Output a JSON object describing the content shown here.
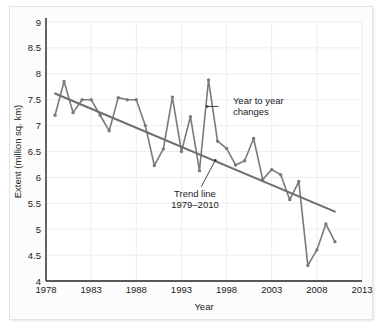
{
  "chart_data": {
    "type": "line",
    "title": "",
    "xlabel": "Year",
    "ylabel": "Extent (million sq. km)",
    "xlim": [
      1978,
      2013
    ],
    "ylim": [
      4,
      9
    ],
    "xticks": [
      1978,
      1983,
      1988,
      1993,
      1998,
      2003,
      2008,
      2013
    ],
    "yticks": [
      4,
      4.5,
      5,
      5.5,
      6,
      6.5,
      7,
      7.5,
      8,
      8.5,
      9
    ],
    "grid": true,
    "legend_position": "none",
    "series": [
      {
        "name": "Year to year changes",
        "color": "#7a7a7a",
        "marker": "circle",
        "x": [
          1979,
          1980,
          1981,
          1982,
          1983,
          1984,
          1985,
          1986,
          1987,
          1988,
          1989,
          1990,
          1991,
          1992,
          1993,
          1994,
          1995,
          1996,
          1997,
          1998,
          1999,
          2000,
          2001,
          2002,
          2003,
          2004,
          2005,
          2006,
          2007,
          2008,
          2009,
          2010
        ],
        "values": [
          7.2,
          7.85,
          7.25,
          7.5,
          7.5,
          7.2,
          6.9,
          7.54,
          7.5,
          7.5,
          7.0,
          6.23,
          6.55,
          7.55,
          6.5,
          7.17,
          6.13,
          7.88,
          6.7,
          6.56,
          6.24,
          6.32,
          6.75,
          5.96,
          6.15,
          6.05,
          5.57,
          5.92,
          4.3,
          4.6,
          5.1,
          4.76
        ]
      },
      {
        "name": "Trend line 1979-2010",
        "color": "#6e6e6e",
        "marker": "none",
        "x": [
          1979,
          2010
        ],
        "values": [
          7.62,
          5.34
        ]
      }
    ],
    "annotations": [
      {
        "name": "year-to-year-changes",
        "lines": [
          "Year to year",
          "changes"
        ],
        "text_x": 1998.7,
        "text_y": 7.42,
        "leader_from_x": 1997.1,
        "leader_from_y": 7.37,
        "leader_to_x": 1995.85,
        "leader_to_y": 7.37
      },
      {
        "name": "trend-line-label",
        "lines": [
          "Trend line",
          "1979–2010"
        ],
        "text_x": 1994.5,
        "text_y": 5.62,
        "leader_from_x": 1995.2,
        "leader_from_y": 5.82,
        "leader_to_x": 1996.75,
        "leader_to_y": 6.33
      }
    ]
  }
}
